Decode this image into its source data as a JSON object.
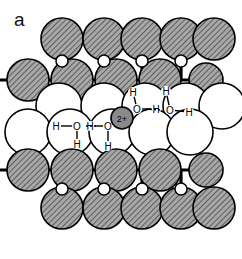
{
  "figure": {
    "panel_label": "a",
    "width": 242,
    "height": 259,
    "background": "#ffffff"
  },
  "legend_semantics": {
    "hatched_atom_label": "lattice-atom-hatched",
    "open_atom_label": "interlayer-atom-open",
    "cation_label": "2+",
    "cation_fill": "#8a8a8a",
    "hatch_fill": "#9b9b9b",
    "open_fill": "#ffffff",
    "stroke": "#000000"
  },
  "chart_data": {
    "type": "diagram",
    "title": "",
    "subtitle": "",
    "colors": {
      "hatched_atom_fill": "#9b9b9b",
      "open_atom_fill": "#ffffff",
      "cation_fill": "#8a8a8a",
      "outline": "#000000",
      "bond": "#000000",
      "background": "#ffffff"
    },
    "rows": [
      {
        "name": "top-lattice-row",
        "style": "hatched",
        "radius": 21,
        "cy": 39,
        "cx": [
          62,
          104,
          142,
          181,
          214
        ]
      },
      {
        "name": "second-lattice-row",
        "style": "hatched",
        "radius": 21,
        "cy": 80,
        "cx": [
          28,
          72,
          116,
          160
        ],
        "small": [
          {
            "cx": 206,
            "cy": 80,
            "r": 17
          }
        ]
      },
      {
        "name": "upper-interlayer-row",
        "style": "open",
        "radius": 23,
        "cy": 106,
        "cx": [
          59,
          104,
          145,
          186,
          222
        ]
      },
      {
        "name": "lower-interlayer-row",
        "style": "open",
        "radius": 23,
        "cy": 132,
        "cx": [
          28,
          70,
          112,
          152,
          190
        ]
      },
      {
        "name": "fifth-lattice-row",
        "style": "hatched",
        "radius": 21,
        "cy": 170,
        "cx": [
          28,
          72,
          116,
          160
        ],
        "small": [
          {
            "cx": 206,
            "cy": 170,
            "r": 17
          }
        ]
      },
      {
        "name": "bottom-lattice-row",
        "style": "hatched",
        "radius": 21,
        "cy": 208,
        "cx": [
          62,
          104,
          142,
          181,
          214
        ]
      }
    ],
    "bridging_atoms": [
      {
        "cx": 62,
        "cy": 61,
        "r": 6
      },
      {
        "cx": 104,
        "cy": 61,
        "r": 6
      },
      {
        "cx": 142,
        "cy": 61,
        "r": 6
      },
      {
        "cx": 181,
        "cy": 61,
        "r": 6
      },
      {
        "cx": 62,
        "cy": 189,
        "r": 6
      },
      {
        "cx": 104,
        "cy": 189,
        "r": 6
      },
      {
        "cx": 142,
        "cy": 189,
        "r": 6
      },
      {
        "cx": 181,
        "cy": 189,
        "r": 6
      }
    ],
    "cation": {
      "label": "2+",
      "cx": 122,
      "cy": 118,
      "r": 11
    },
    "water_molecules": [
      {
        "id": "water-left",
        "o": {
          "x": 77,
          "y": 126
        },
        "h": [
          {
            "x": 56,
            "y": 126,
            "label": "H"
          },
          {
            "x": 77,
            "y": 144,
            "label": "H"
          }
        ],
        "o_label": "O"
      },
      {
        "id": "water-mid-lower",
        "o": {
          "x": 108,
          "y": 126
        },
        "h": [
          {
            "x": 90,
            "y": 126,
            "label": "H"
          },
          {
            "x": 108,
            "y": 146,
            "label": "H"
          }
        ],
        "o_label": "O"
      },
      {
        "id": "water-mid-upper",
        "o": {
          "x": 137,
          "y": 109
        },
        "h": [
          {
            "x": 133,
            "y": 92,
            "label": "H"
          },
          {
            "x": 156,
            "y": 109,
            "label": "H"
          }
        ],
        "o_label": "O"
      },
      {
        "id": "water-right",
        "o": {
          "x": 170,
          "y": 110
        },
        "h": [
          {
            "x": 166,
            "y": 91,
            "label": "H"
          },
          {
            "x": 189,
            "y": 112,
            "label": "H"
          }
        ],
        "o_label": "O"
      }
    ],
    "hydrogen_bonds": [
      {
        "from": "water-left-H",
        "to": "water-mid-lower-O",
        "x1": 86,
        "y1": 126,
        "x2": 97,
        "y2": 126
      },
      {
        "from": "water-mid-upper-H",
        "to": "water-right-O",
        "x1": 146,
        "y1": 109,
        "x2": 160,
        "y2": 110
      }
    ],
    "legend": [],
    "xlabel": "",
    "ylabel": "",
    "grid": false
  }
}
